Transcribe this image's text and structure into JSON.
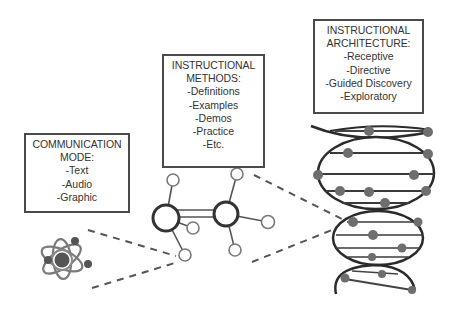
{
  "diagram": {
    "colors": {
      "stroke": "#2b2b2b",
      "dot": "#6e6e6e",
      "dash": "#555555",
      "box_border": "#4a4a4a",
      "text": "#333333"
    },
    "boxes": {
      "communication": {
        "title_line1": "COMMUNICATION",
        "title_line2": "MODE:",
        "items": [
          "-Text",
          "-Audio",
          "-Graphic"
        ]
      },
      "methods": {
        "title_line1": "INSTRUCTIONAL",
        "title_line2": "METHODS:",
        "items": [
          "-Definitions",
          "-Examples",
          "-Demos",
          "-Practice",
          "-Etc."
        ]
      },
      "architecture": {
        "title_line1": "INSTRUCTIONAL",
        "title_line2": "ARCHITECTURE:",
        "items": [
          "-Receptive",
          "-Directive",
          "-Guided Discovery",
          "-Exploratory"
        ]
      }
    },
    "icons": {
      "atom": "atom-icon",
      "molecule": "molecule-icon",
      "dna": "dna-helix-icon"
    }
  }
}
